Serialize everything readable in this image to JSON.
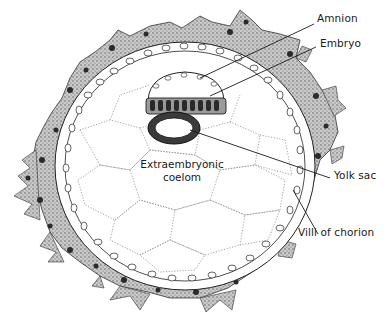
{
  "figure": {
    "type": "histology-diagram",
    "colors": {
      "ink": "#1a1a1a",
      "stipple": "#8a8a8a",
      "villi_fill": "#b5b5b5",
      "background": "#ffffff"
    }
  },
  "labels": {
    "amnion": "Amnion",
    "embryo": "Embryo",
    "yolk_sac": "Yolk sac",
    "villi": "Villi of chorion",
    "coelom_line1": "Extraembryonic",
    "coelom_line2": "coelom"
  }
}
